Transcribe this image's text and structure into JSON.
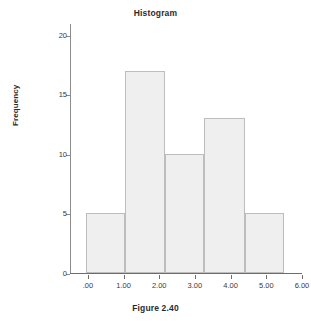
{
  "chart_data": {
    "type": "bar",
    "title": "Histogram",
    "subtitle": "",
    "xlabel": "",
    "ylabel": "Frequency",
    "caption": "Figure 2.40",
    "grid": false,
    "legend": "none",
    "xlim": [
      -0.5,
      6.0
    ],
    "ylim": [
      0,
      21
    ],
    "x_tick_labels": [
      ".00",
      "1.00",
      "2.00",
      "3.00",
      "4.00",
      "5.00",
      "6.00"
    ],
    "x_tick_values": [
      0,
      1,
      2,
      3,
      4,
      5,
      6
    ],
    "y_tick_labels": [
      "0",
      "5",
      "10",
      "15",
      "20"
    ],
    "y_tick_values": [
      0,
      5,
      10,
      15,
      20
    ],
    "bins": [
      {
        "label": "bin-1",
        "x_start": -0.05,
        "x_end": 1.05,
        "value": 5
      },
      {
        "label": "bin-2",
        "x_start": 1.05,
        "x_end": 2.15,
        "value": 17
      },
      {
        "label": "bin-3",
        "x_start": 2.15,
        "x_end": 3.25,
        "value": 10
      },
      {
        "label": "bin-4",
        "x_start": 3.25,
        "x_end": 4.4,
        "value": 13
      },
      {
        "label": "bin-5",
        "x_start": 4.4,
        "x_end": 5.5,
        "value": 5
      }
    ],
    "values": [
      5,
      17,
      10,
      13,
      5
    ],
    "colors": {
      "bar_fill": "#efefef",
      "bar_border": "#bdbdbd",
      "axis": "#6d6d6d",
      "text": "#2b2b2b",
      "background": "#ffffff"
    }
  }
}
